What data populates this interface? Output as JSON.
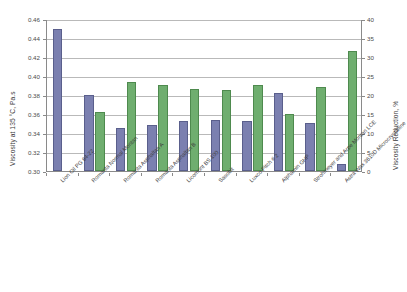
{
  "chart_data": {
    "type": "bar",
    "title": "",
    "subtitle": "",
    "categories": [
      "Lion Oil PG 64-22",
      "Romanta Normal Montan",
      "Romanta Asphaltan A",
      "Romanta Asphaltan B",
      "Licomont BS 100",
      "Sasobit",
      "Luxco Pitch # 2",
      "Alphamin GHP",
      "Strohmeyer and Arpe Montan LCE",
      "Astra Wax 3610D Microcrystalline"
    ],
    "series": [
      {
        "name": "Viscosity at 135 °C, Pa.s",
        "axis": "left",
        "color": "#7b80b0",
        "values": [
          0.45,
          0.38,
          0.345,
          0.348,
          0.353,
          0.3535,
          0.3525,
          0.382,
          0.3505,
          0.3075
        ]
      },
      {
        "name": "Viscosity Reduction, %",
        "axis": "right",
        "color": "#6fae6f",
        "values": [
          null,
          15.5,
          23.3,
          22.7,
          21.5,
          21.4,
          22.7,
          15.0,
          22.2,
          31.7
        ]
      }
    ],
    "xlabel": "",
    "ylabel": "Viscosity at 135 °C, Pa.s",
    "y2label": "Viscosity Reduction, %",
    "ylim": [
      0.3,
      0.46
    ],
    "y2lim": [
      0,
      40
    ],
    "yticks": [
      "0.30",
      "0.32",
      "0.34",
      "0.36",
      "0.38",
      "0.40",
      "0.42",
      "0.44",
      "0.46"
    ],
    "y2ticks": [
      "0",
      "5",
      "10",
      "15",
      "20",
      "25",
      "30",
      "35",
      "40"
    ],
    "grid": "horizontal",
    "legend": "none"
  },
  "axes": {
    "left_title": "Viscosity at 135 °C, Pa.s",
    "right_title": "Viscosity Reduction, %"
  }
}
